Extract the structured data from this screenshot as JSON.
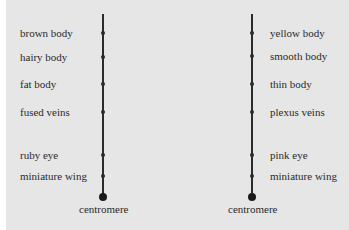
{
  "diagram": {
    "left_chromosome": {
      "genes": [
        {
          "label": "brown body",
          "y": 33
        },
        {
          "label": "hairy body",
          "y": 57
        },
        {
          "label": "fat body",
          "y": 84
        },
        {
          "label": "fused veins",
          "y": 112
        },
        {
          "label": "ruby eye",
          "y": 155
        },
        {
          "label": "miniature wing",
          "y": 176
        }
      ],
      "centromere_label": "centromere"
    },
    "right_chromosome": {
      "genes": [
        {
          "label": "yellow body",
          "y": 33
        },
        {
          "label": "smooth body",
          "y": 56
        },
        {
          "label": "thin body",
          "y": 84
        },
        {
          "label": "plexus veins",
          "y": 112
        },
        {
          "label": "pink eye",
          "y": 155
        },
        {
          "label": "miniature wing",
          "y": 176
        }
      ],
      "centromere_label": "centromere"
    },
    "colors": {
      "background": "#e6e6e6",
      "ink": "#2a2a2a"
    }
  }
}
